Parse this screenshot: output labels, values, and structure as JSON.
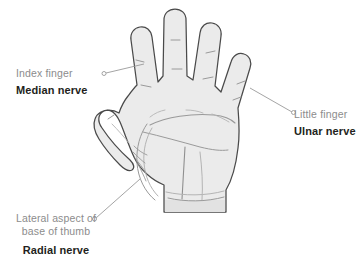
{
  "figure": {
    "type": "anatomical-diagram",
    "background_color": "#ffffff"
  },
  "illustration": {
    "name": "hand-palm-illustration",
    "fill_color": "#ebebeb",
    "outline_color": "#4a4a4a",
    "crease_color": "#9a9a9a",
    "view": "palm",
    "digits": [
      "thumb",
      "index finger",
      "middle finger",
      "ring finger",
      "little finger"
    ]
  },
  "callouts": [
    {
      "id": "median",
      "part_label": "Index finger",
      "nerve_label": "Median nerve",
      "leader_color": "#9a9a9a",
      "marker": "open-circle",
      "target": "index finger pad"
    },
    {
      "id": "ulnar",
      "part_label": "Little finger",
      "nerve_label": "Ulnar nerve",
      "leader_color": "#9a9a9a",
      "marker": "open-circle",
      "target": "little finger pad"
    },
    {
      "id": "radial",
      "part_label_line1": "Lateral aspect of",
      "part_label_line2": "base of thumb",
      "nerve_label": "Radial nerve",
      "leader_color": "#9a9a9a",
      "marker": "open-circle",
      "target": "lateral aspect of base of thumb"
    }
  ],
  "colors": {
    "part_text": "#8c8c8c",
    "nerve_text": "#231f20",
    "hand_fill": "#ebebeb",
    "hand_outline": "#4a4a4a",
    "leader_line": "#9a9a9a"
  }
}
